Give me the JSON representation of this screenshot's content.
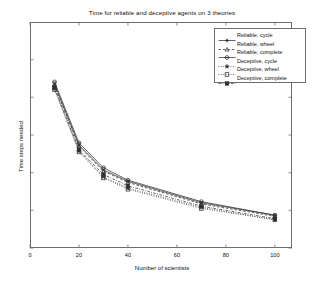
{
  "chart_data": {
    "type": "line",
    "title": "Time for reliable and deceptive agents on 3 theories",
    "xlabel": "Number of scientists",
    "ylabel": "Time steps needed",
    "x": [
      10,
      20,
      30,
      40,
      70,
      100
    ],
    "xlim": [
      0,
      107
    ],
    "ylim": [
      0,
      100
    ],
    "xticks": [
      0,
      20,
      40,
      60,
      80,
      100
    ],
    "xtick_labels": [
      "0",
      "20",
      "40",
      "60",
      "80",
      "100"
    ],
    "yticks": [
      0,
      16.7,
      33.3,
      50,
      66.7,
      83.3
    ],
    "ytick_labels": [
      "",
      "",
      "",
      "",
      "",
      ""
    ],
    "grid": false,
    "legend_position": "upper right",
    "series": [
      {
        "name": "Reliable, cycle",
        "marker": "asterisk",
        "linestyle": "solid",
        "color": "#303030",
        "values": [
          72.5,
          45.5,
          34.5,
          29.5,
          20.0,
          14.5
        ]
      },
      {
        "name": "Reliable, wheel",
        "marker": "triangle",
        "linestyle": "dashed",
        "color": "#303030",
        "values": [
          72.0,
          45.0,
          34.0,
          29.0,
          19.5,
          14.0
        ]
      },
      {
        "name": "Reliable, complete",
        "marker": "circle-plus",
        "linestyle": "solid",
        "color": "#303030",
        "values": [
          73.5,
          46.5,
          35.5,
          30.0,
          20.5,
          14.5
        ]
      },
      {
        "name": "Deceptive, cycle",
        "marker": "star",
        "linestyle": "dotted",
        "color": "#303030",
        "values": [
          70.5,
          43.0,
          31.5,
          26.5,
          18.0,
          12.5
        ]
      },
      {
        "name": "Deceptive, wheel",
        "marker": "square-open",
        "linestyle": "dotted",
        "color": "#303030",
        "values": [
          70.0,
          42.5,
          31.0,
          26.0,
          17.5,
          12.5
        ]
      },
      {
        "name": "Deceptive, complete",
        "marker": "square-filled",
        "linestyle": "dash-dot",
        "color": "#303030",
        "values": [
          71.0,
          43.5,
          32.5,
          27.5,
          18.5,
          13.0
        ]
      }
    ]
  },
  "legend": {
    "items": [
      {
        "label": "Reliable, cycle"
      },
      {
        "label": "Reliable, wheel"
      },
      {
        "label": "Reliable, complete"
      },
      {
        "label": "Deceptive, cycle"
      },
      {
        "label": "Deceptive, wheel"
      },
      {
        "label": "Deceptive, complete"
      }
    ]
  }
}
